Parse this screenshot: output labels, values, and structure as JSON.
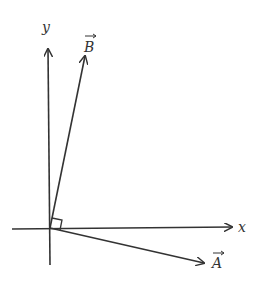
{
  "diagram": {
    "type": "vector-diagram",
    "colors": {
      "stroke": "#333333",
      "background": "#ffffff"
    },
    "origin": [
      50,
      228
    ],
    "axes": {
      "x": {
        "label": "x",
        "from": [
          12,
          229
        ],
        "to": [
          233,
          227
        ]
      },
      "y": {
        "label": "y",
        "from": [
          50,
          265
        ],
        "to": [
          48,
          48
        ]
      }
    },
    "vectors": [
      {
        "name": "B",
        "label": "B",
        "arrow_over": true,
        "from": [
          50,
          228
        ],
        "to": [
          85,
          55
        ]
      },
      {
        "name": "A",
        "label": "A",
        "arrow_over": true,
        "from": [
          50,
          228
        ],
        "to": [
          205,
          263
        ]
      }
    ],
    "annotations": [
      {
        "type": "right-angle-marker",
        "between": [
          "A",
          "B"
        ],
        "at": [
          50,
          228
        ]
      }
    ]
  }
}
